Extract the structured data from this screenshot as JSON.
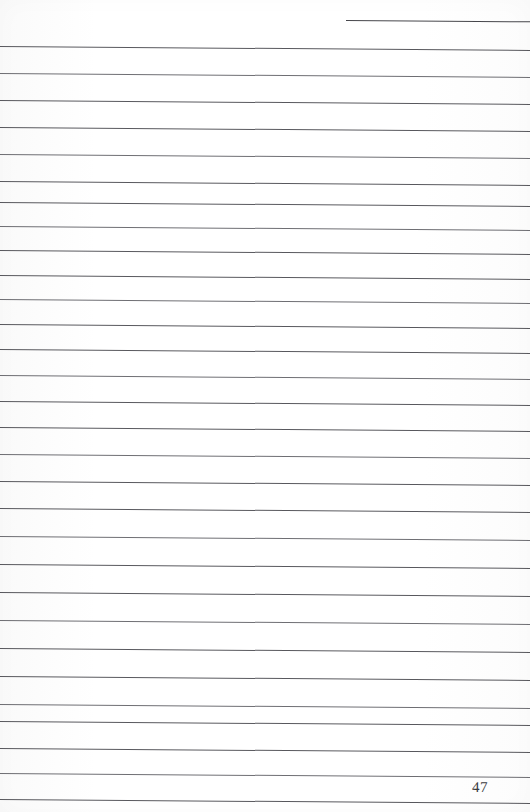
{
  "document": {
    "type": "ruled-notebook-page",
    "page_number": "47",
    "background_color": "#fdfdfd",
    "rule_color": "#4a4a4f",
    "rule_count": 29,
    "rule_spacing_px": 27.5,
    "skew_degrees": 0.42,
    "content_text": ""
  },
  "rules": [
    {
      "id": "rule-01",
      "top": 20,
      "left": 346,
      "width": 184,
      "kind": "short"
    },
    {
      "id": "rule-02",
      "top": 46,
      "left": 0,
      "width": 530,
      "kind": "full"
    },
    {
      "id": "rule-03",
      "top": 73,
      "left": 0,
      "width": 530,
      "kind": "full"
    },
    {
      "id": "rule-04",
      "top": 100,
      "left": 0,
      "width": 530,
      "kind": "full"
    },
    {
      "id": "rule-05",
      "top": 127,
      "left": 0,
      "width": 530,
      "kind": "full"
    },
    {
      "id": "rule-06",
      "top": 154,
      "left": 0,
      "width": 530,
      "kind": "full"
    },
    {
      "id": "rule-07",
      "top": 181,
      "left": 0,
      "width": 530,
      "kind": "full"
    },
    {
      "id": "rule-08",
      "top": 202,
      "left": 0,
      "width": 530,
      "kind": "full"
    },
    {
      "id": "rule-09",
      "top": 226,
      "left": 0,
      "width": 530,
      "kind": "full"
    },
    {
      "id": "rule-10",
      "top": 250,
      "left": 0,
      "width": 530,
      "kind": "full"
    },
    {
      "id": "rule-11",
      "top": 275,
      "left": 0,
      "width": 530,
      "kind": "full"
    },
    {
      "id": "rule-12",
      "top": 299,
      "left": 0,
      "width": 530,
      "kind": "full"
    },
    {
      "id": "rule-13",
      "top": 324,
      "left": 0,
      "width": 530,
      "kind": "full"
    },
    {
      "id": "rule-14",
      "top": 349,
      "left": 0,
      "width": 530,
      "kind": "full"
    },
    {
      "id": "rule-15",
      "top": 375,
      "left": 0,
      "width": 530,
      "kind": "full"
    },
    {
      "id": "rule-16",
      "top": 401,
      "left": 0,
      "width": 530,
      "kind": "full"
    },
    {
      "id": "rule-17",
      "top": 427,
      "left": 0,
      "width": 530,
      "kind": "full"
    },
    {
      "id": "rule-18",
      "top": 454,
      "left": 0,
      "width": 530,
      "kind": "full"
    },
    {
      "id": "rule-19",
      "top": 481,
      "left": 0,
      "width": 530,
      "kind": "full"
    },
    {
      "id": "rule-20",
      "top": 508,
      "left": 0,
      "width": 530,
      "kind": "full"
    },
    {
      "id": "rule-21",
      "top": 536,
      "left": 0,
      "width": 530,
      "kind": "full"
    },
    {
      "id": "rule-22",
      "top": 564,
      "left": 0,
      "width": 530,
      "kind": "full"
    },
    {
      "id": "rule-23",
      "top": 592,
      "left": 0,
      "width": 530,
      "kind": "full"
    },
    {
      "id": "rule-24",
      "top": 620,
      "left": 0,
      "width": 530,
      "kind": "full"
    },
    {
      "id": "rule-25",
      "top": 648,
      "left": 0,
      "width": 530,
      "kind": "full"
    },
    {
      "id": "rule-26",
      "top": 676,
      "left": 0,
      "width": 530,
      "kind": "full"
    },
    {
      "id": "rule-27",
      "top": 704,
      "left": 0,
      "width": 530,
      "kind": "full"
    },
    {
      "id": "rule-28",
      "top": 721,
      "left": 0,
      "width": 530,
      "kind": "full"
    },
    {
      "id": "rule-29",
      "top": 748,
      "left": 0,
      "width": 530,
      "kind": "full"
    },
    {
      "id": "rule-30",
      "top": 773,
      "left": 0,
      "width": 530,
      "kind": "full"
    },
    {
      "id": "rule-31",
      "top": 799,
      "left": 0,
      "width": 530,
      "kind": "full"
    }
  ],
  "page_number_position": {
    "left": 472,
    "top": 779
  }
}
